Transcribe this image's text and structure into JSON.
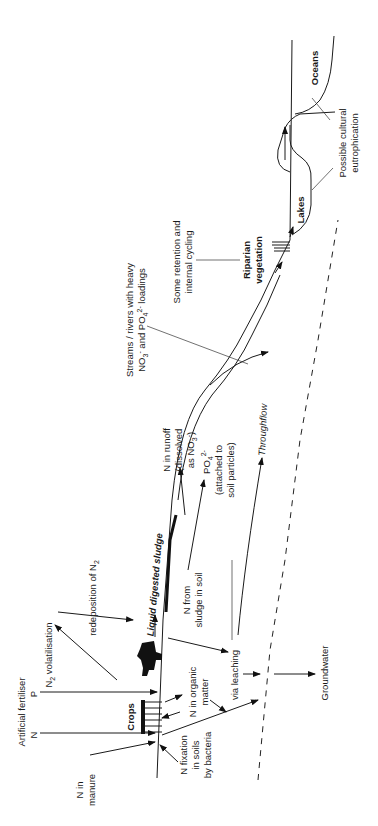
{
  "diagram": {
    "orientation": "rotated 90deg counter-clockwise",
    "labels": {
      "n_in_manure": [
        "N in",
        "manure"
      ],
      "artificial_fertiliser": "Artificial fertiliser",
      "fert_n": "N",
      "fert_p": "P",
      "crops": "Crops",
      "n2_volatilisation": "N",
      "n2_volatilisation_sub": "2",
      "n2_volatilisation_rest": " volatilisation",
      "redeposition": "redeposition of N",
      "redeposition_sub": "2",
      "liquid_sludge": "Liquid digested sludge",
      "n_from_sludge": [
        "N from",
        "sludge in soil"
      ],
      "n_organic": [
        "N in organic",
        "matter"
      ],
      "n_fixation": [
        "N fixation",
        "in soils",
        "by bacteria"
      ],
      "via_leaching": "via leaching",
      "groundwater": "Groundwater",
      "throughflow": "Throughflow",
      "n_runoff": [
        "N in runoff",
        "(dissolved",
        "as NO"
      ],
      "po4": "PO",
      "po4_attached": [
        "(attached to",
        "soil particles)"
      ],
      "streams": [
        "Streams / rivers with heavy",
        "NO"
      ],
      "streams_and": " and PO",
      "streams_loadings": " loadings",
      "retention": [
        "Some retention and",
        "internal cycling"
      ],
      "riparian": [
        "Riparian",
        "vegetation"
      ],
      "lakes": "Lakes",
      "oceans": "Oceans",
      "eutrophication": [
        "Possible cultural",
        "eutrophication"
      ]
    },
    "nodes": [
      "Crops",
      "Livestock",
      "Liquid digested sludge",
      "Soil",
      "Groundwater",
      "Streams / rivers",
      "Riparian vegetation",
      "Lakes",
      "Oceans"
    ],
    "flows": [
      {
        "from": "Manure",
        "to": "Soil",
        "label": "N in manure"
      },
      {
        "from": "Artificial fertiliser",
        "to": "Soil",
        "label": "N"
      },
      {
        "from": "Artificial fertiliser",
        "to": "Soil",
        "label": "P"
      },
      {
        "from": "Soil",
        "to": "Atmosphere",
        "label": "N2 volatilisation"
      },
      {
        "from": "Atmosphere",
        "to": "Soil",
        "label": "redeposition of N2"
      },
      {
        "from": "Bacteria",
        "to": "Soil",
        "label": "N fixation in soils by bacteria"
      },
      {
        "from": "Soil",
        "to": "Groundwater",
        "label": "via leaching"
      },
      {
        "from": "Soil",
        "to": "Streams / rivers",
        "label": "N in runoff (dissolved as NO3-)"
      },
      {
        "from": "Soil",
        "to": "Streams / rivers",
        "label": "PO4 2- (attached to soil particles)"
      },
      {
        "from": "Soil",
        "to": "Streams / rivers",
        "label": "Throughflow"
      },
      {
        "from": "Streams / rivers",
        "to": "Lakes",
        "label": ""
      },
      {
        "from": "Lakes",
        "to": "Oceans",
        "label": ""
      }
    ]
  }
}
